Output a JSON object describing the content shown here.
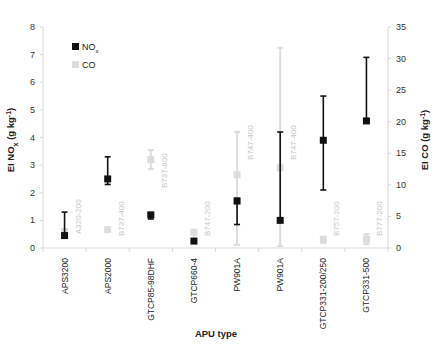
{
  "chart_data": {
    "type": "scatter",
    "title": "",
    "xlabel": "APU type",
    "ylabel_left": "EI NOx (g kg-1)",
    "ylabel_right": "EI CO (g kg-1)",
    "ylim_left": [
      0,
      8
    ],
    "ylim_right": [
      0,
      35
    ],
    "yticks_left": [
      "0",
      "1",
      "2",
      "3",
      "4",
      "5",
      "6",
      "7",
      "8"
    ],
    "yticks_right": [
      "0",
      "5",
      "10",
      "15",
      "20",
      "25",
      "30",
      "35"
    ],
    "grid": false,
    "legend_position": "top-left",
    "legend": [
      {
        "name": "NOx",
        "label": "NO",
        "sub": "x",
        "color": "#111111"
      },
      {
        "name": "CO",
        "label": "CO",
        "sub": "",
        "color": "#dcdcdc"
      }
    ],
    "categories": [
      "APS3200",
      "APS2000",
      "GTCP85-98DHF",
      "GTCP660-4",
      "PW901A",
      "PW901A",
      "GTCP331-200/250",
      "GTCP331-500"
    ],
    "aircraft_annotations": [
      "A320-200",
      "B737-400",
      "B737-800",
      "B747-200",
      "B747-400",
      "B747-400",
      "B757-200",
      "B777-200"
    ],
    "series": [
      {
        "name": "NOx",
        "axis": "left",
        "color": "#111111",
        "values": [
          0.45,
          2.5,
          1.2,
          0.25,
          1.7,
          1.0,
          3.9,
          4.6
        ],
        "err_low": [
          0.4,
          2.3,
          1.05,
          0.2,
          0.85,
          0.95,
          2.1,
          4.6
        ],
        "err_high": [
          1.3,
          3.3,
          1.25,
          0.3,
          1.8,
          4.2,
          5.5,
          6.9
        ]
      },
      {
        "name": "CO",
        "axis": "right",
        "color": "#dcdcdc",
        "values": [
          2.6,
          2.9,
          14.0,
          2.5,
          11.6,
          12.7,
          1.3,
          1.4
        ],
        "err_low": [
          2.3,
          2.6,
          12.5,
          1.5,
          0.5,
          0.3,
          0.8,
          0.6
        ],
        "err_high": [
          3.0,
          3.2,
          15.5,
          2.8,
          18.4,
          31.7,
          1.8,
          2.2
        ]
      }
    ]
  }
}
